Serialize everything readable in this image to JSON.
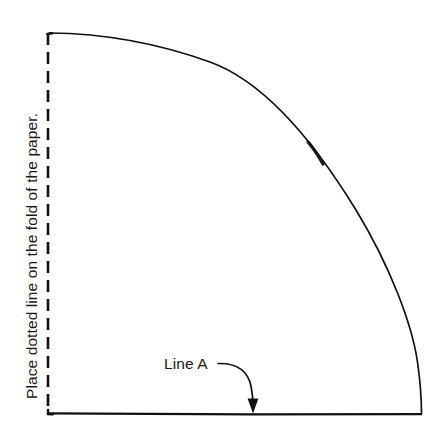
{
  "canvas": {
    "width": 444,
    "height": 443,
    "background": "#ffffff",
    "ink_color": "#111111"
  },
  "labels": {
    "fold_instruction": "Place dotted line on the fold of the paper.",
    "line_a": "Line A"
  },
  "geometry": {
    "dashed_fold_line": {
      "orientation": "vertical",
      "x": 48,
      "y_start": 33,
      "y_end": 414,
      "dash_length": 12,
      "gap_length": 7,
      "stroke_width": 2.4
    },
    "baseline": {
      "orientation": "horizontal",
      "y": 414,
      "x_start": 48,
      "x_end": 422,
      "stroke_width": 2.2
    },
    "arc": {
      "start": [
        50,
        33
      ],
      "end": [
        421,
        414
      ],
      "stroke_width": 1.7,
      "description": "convex quarter arc from top-left to bottom-right"
    },
    "leader_arrow": {
      "tail": [
        218,
        363
      ],
      "tip": [
        253,
        413
      ],
      "stroke_width": 1.6
    }
  }
}
